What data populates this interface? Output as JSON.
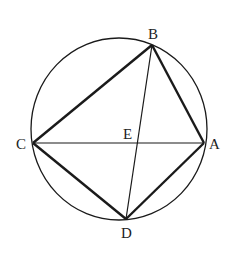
{
  "diagram": {
    "type": "geometry-cyclic-quadrilateral",
    "circle": {
      "cx": 119,
      "cy": 129,
      "rx": 88,
      "ry": 91
    },
    "points": {
      "A": {
        "label": "A",
        "x": 204,
        "y": 143,
        "lx": 209,
        "ly": 149
      },
      "B": {
        "label": "B",
        "x": 152,
        "y": 45,
        "lx": 148,
        "ly": 39
      },
      "C": {
        "label": "C",
        "x": 33,
        "y": 143,
        "lx": 16,
        "ly": 149
      },
      "D": {
        "label": "D",
        "x": 126,
        "y": 219,
        "lx": 121,
        "ly": 238
      },
      "E": {
        "label": "E",
        "x": 138,
        "y": 143,
        "lx": 123,
        "ly": 139
      }
    },
    "segments": [
      {
        "from": "C",
        "to": "B",
        "weight": "thick"
      },
      {
        "from": "B",
        "to": "A",
        "weight": "thick"
      },
      {
        "from": "A",
        "to": "D",
        "weight": "thick"
      },
      {
        "from": "D",
        "to": "C",
        "weight": "thick"
      },
      {
        "from": "C",
        "to": "A",
        "weight": "thin"
      },
      {
        "from": "B",
        "to": "D",
        "weight": "thin"
      }
    ],
    "colors": {
      "stroke": "#1a1a1a",
      "label": "#222222",
      "background": "#ffffff"
    }
  }
}
